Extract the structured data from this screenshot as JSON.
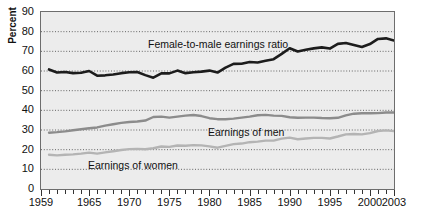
{
  "axes": {
    "ylabel": "Percent",
    "yticks": [
      0,
      10,
      20,
      30,
      40,
      50,
      60,
      70,
      80,
      90
    ],
    "ylim": [
      0,
      90
    ],
    "xlim": [
      1959,
      2003
    ],
    "xlabels": [
      "1959",
      "1965",
      "1970",
      "1975",
      "1980",
      "1985",
      "1990",
      "1995",
      "2000",
      "2003"
    ],
    "xlabel_years": [
      1959,
      1965,
      1970,
      1975,
      1980,
      1985,
      1990,
      1995,
      2000,
      2003
    ]
  },
  "annotations": {
    "ratio": "Female-to-male earnings ratio",
    "men": "Earnings of men",
    "women": "Earnings of women"
  },
  "colors": {
    "plot_background": "#ececec",
    "frame": "#6d6d6d",
    "gridline": "#555555",
    "ratio_line": "#1c1c1c",
    "men_line": "#8c8c8c",
    "women_line": "#b4b4b4"
  },
  "chart_data": {
    "type": "line",
    "title": "",
    "xlabel": "",
    "ylabel": "Percent",
    "xlim": [
      1959,
      2003
    ],
    "ylim": [
      0,
      90
    ],
    "grid": true,
    "legend": "inline-annotations",
    "x": [
      1960,
      1961,
      1962,
      1963,
      1964,
      1965,
      1966,
      1967,
      1968,
      1969,
      1970,
      1971,
      1972,
      1973,
      1974,
      1975,
      1976,
      1977,
      1978,
      1979,
      1980,
      1981,
      1982,
      1983,
      1984,
      1985,
      1986,
      1987,
      1988,
      1989,
      1990,
      1991,
      1992,
      1993,
      1994,
      1995,
      1996,
      1997,
      1998,
      1999,
      2000,
      2001,
      2002,
      2003
    ],
    "series": [
      {
        "name": "Female-to-male earnings ratio",
        "values": [
          60.8,
          59.2,
          59.5,
          58.9,
          59.1,
          60.0,
          57.6,
          57.8,
          58.2,
          58.9,
          59.4,
          59.5,
          57.9,
          56.6,
          58.8,
          58.8,
          60.2,
          58.9,
          59.4,
          59.7,
          60.2,
          59.2,
          61.7,
          63.6,
          63.7,
          64.6,
          64.3,
          65.2,
          66.0,
          68.7,
          71.6,
          69.9,
          70.8,
          71.5,
          72.0,
          71.4,
          73.8,
          74.2,
          73.2,
          72.2,
          73.7,
          76.3,
          76.6,
          75.5
        ]
      },
      {
        "name": "Earnings of men",
        "values": [
          28.6,
          28.9,
          29.3,
          29.9,
          30.4,
          30.9,
          31.3,
          32.2,
          32.9,
          33.6,
          34.1,
          34.3,
          34.8,
          36.6,
          36.8,
          36.3,
          36.8,
          37.3,
          37.6,
          37.1,
          36.0,
          35.5,
          35.5,
          35.8,
          36.3,
          36.8,
          37.5,
          37.7,
          37.3,
          37.2,
          36.5,
          36.2,
          36.3,
          36.3,
          36.1,
          36.0,
          36.2,
          37.4,
          38.3,
          38.5,
          38.5,
          38.6,
          38.9,
          38.9
        ]
      },
      {
        "name": "Earnings of women",
        "values": [
          17.4,
          17.1,
          17.4,
          17.6,
          18.0,
          18.5,
          18.0,
          18.6,
          19.2,
          19.8,
          20.3,
          20.4,
          20.2,
          20.7,
          21.6,
          21.4,
          22.1,
          22.0,
          22.3,
          22.2,
          21.7,
          21.0,
          21.9,
          22.8,
          23.1,
          23.8,
          24.1,
          24.6,
          24.6,
          25.6,
          26.1,
          25.3,
          25.7,
          26.0,
          26.0,
          25.7,
          26.7,
          27.8,
          28.0,
          27.8,
          28.4,
          29.5,
          29.8,
          29.4
        ]
      }
    ]
  }
}
